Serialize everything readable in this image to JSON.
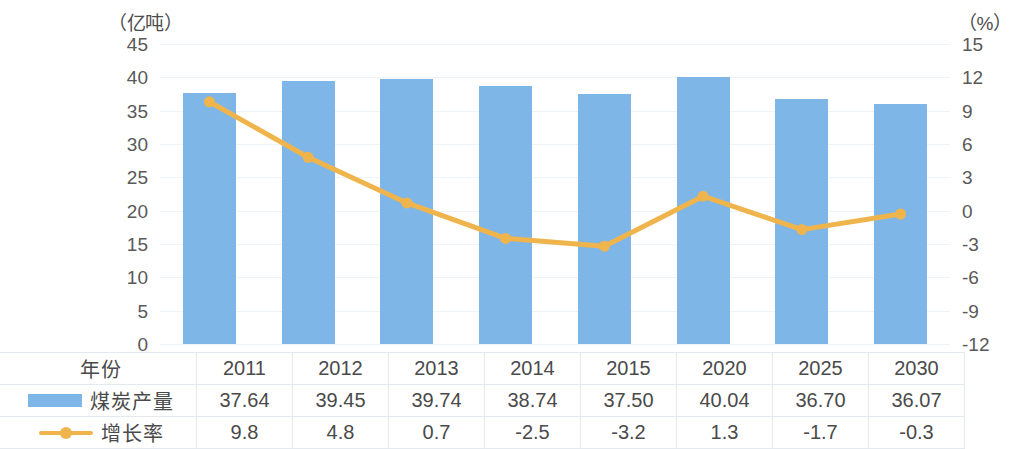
{
  "chart_data": {
    "type": "bar",
    "title": "",
    "subtitle": "",
    "xlabel": "",
    "ylabel": "（亿吨）",
    "y2label": "（%）",
    "grid": true,
    "legend_position": "table-row-headers",
    "categories": [
      "2011",
      "2012",
      "2013",
      "2014",
      "2015",
      "2020",
      "2025",
      "2030"
    ],
    "ylim": [
      0,
      45
    ],
    "y_ticks": [
      "45",
      "40",
      "35",
      "30",
      "25",
      "20",
      "15",
      "10",
      "5",
      "0"
    ],
    "y2lim": [
      -12,
      15
    ],
    "y2_ticks": [
      "15",
      "12",
      "9",
      "6",
      "3",
      "0",
      "-3",
      "-6",
      "-9",
      "-12"
    ],
    "series": [
      {
        "name": "煤炭产量",
        "type": "bar",
        "axis": "left",
        "color": "#7eb6e8",
        "values": [
          37.64,
          39.45,
          39.74,
          38.74,
          37.5,
          40.04,
          36.7,
          36.07
        ],
        "labels": [
          "37.64",
          "39.45",
          "39.74",
          "38.74",
          "37.50",
          "40.04",
          "36.70",
          "36.07"
        ]
      },
      {
        "name": "增长率",
        "type": "line",
        "axis": "right",
        "color": "#f0b44c",
        "values": [
          9.8,
          4.8,
          0.7,
          -2.5,
          -3.2,
          1.3,
          -1.7,
          -0.3
        ],
        "labels": [
          "9.8",
          "4.8",
          "0.7",
          "-2.5",
          "-3.2",
          "1.3",
          "-1.7",
          "-0.3"
        ]
      }
    ]
  },
  "table": {
    "rows": [
      {
        "label": "年份",
        "marker": "none",
        "values": [
          "2011",
          "2012",
          "2013",
          "2014",
          "2015",
          "2020",
          "2025",
          "2030"
        ]
      },
      {
        "label": "煤炭产量",
        "marker": "bar",
        "values": [
          "37.64",
          "39.45",
          "39.74",
          "38.74",
          "37.50",
          "40.04",
          "36.70",
          "36.07"
        ]
      },
      {
        "label": "增长率",
        "marker": "line",
        "values": [
          "9.8",
          "4.8",
          "0.7",
          "-2.5",
          "-3.2",
          "1.3",
          "-1.7",
          "-0.3"
        ]
      }
    ]
  },
  "colors": {
    "bar": "#7eb6e8",
    "line": "#f0b44c",
    "grid": "#eef3f7",
    "table_border": "#e3e9ef",
    "text": "#59595a"
  }
}
